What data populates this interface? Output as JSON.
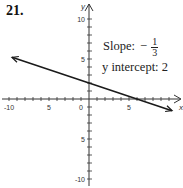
{
  "problem_number": "21.",
  "annotations": {
    "slope_label": "Slope:",
    "slope_sign": "−",
    "slope_num": "1",
    "slope_den": "3",
    "intercept_label": "y intercept: 2"
  },
  "colors": {
    "line": "#1a1a1a",
    "axis": "#333333",
    "text": "#222222"
  },
  "chart_data": {
    "type": "line",
    "title": "",
    "xlabel": "x",
    "ylabel": "y",
    "xlim": [
      -10,
      10
    ],
    "ylim": [
      -10,
      10
    ],
    "x_ticks": [
      -10,
      -5,
      0,
      5
    ],
    "y_ticks": [
      10,
      5,
      -5,
      -10
    ],
    "x_tick_labels": [
      "-10",
      "5",
      "0",
      "5"
    ],
    "y_tick_labels": [
      "10",
      "5",
      "5",
      "-10"
    ],
    "grid": false,
    "series": [
      {
        "name": "y = -1/3 x + 2",
        "slope": -0.3333,
        "intercept": 2,
        "x": [
          -10,
          10
        ],
        "y": [
          5.33,
          -1.33
        ],
        "arrows_both_ends": true
      }
    ],
    "annotations": [
      "Slope: -1/3",
      "y intercept: 2"
    ]
  }
}
